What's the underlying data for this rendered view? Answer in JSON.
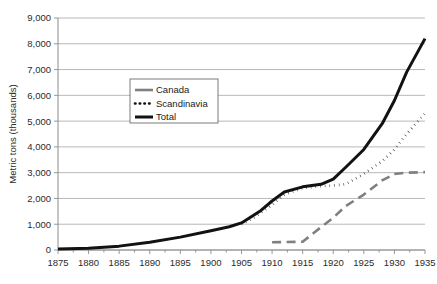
{
  "chart_data": {
    "type": "line",
    "title": "",
    "xlabel": "",
    "ylabel": "Metric tons (thousands)",
    "xlim": [
      1875,
      1935
    ],
    "ylim": [
      0,
      9000
    ],
    "ytick_step": 1000,
    "xtick_step": 5,
    "grid": true,
    "legend_position": "upper-left-inside",
    "xticklabels": [
      "1875",
      "1880",
      "1885",
      "1890",
      "1895",
      "1900",
      "1905",
      "1910",
      "1915",
      "1920",
      "1925",
      "1930",
      "1935"
    ],
    "yticklabels": [
      "0",
      "1,000",
      "2,000",
      "3,000",
      "4,000",
      "5,000",
      "6,000",
      "7,000",
      "8,000",
      "9,000"
    ],
    "series": [
      {
        "name": "Canada",
        "style": "dashed",
        "color": "#808080",
        "width": 2.6,
        "x": [
          1910,
          1915,
          1917,
          1920,
          1922,
          1925,
          1928,
          1930,
          1932,
          1935
        ],
        "values": [
          300,
          320,
          700,
          1250,
          1700,
          2150,
          2700,
          2950,
          3000,
          3020
        ]
      },
      {
        "name": "Scandinavia",
        "style": "dotted",
        "color": "#121212",
        "width": 2.6,
        "x": [
          1905,
          1907,
          1910,
          1912,
          1915,
          1918,
          1920,
          1922,
          1925,
          1928,
          1930,
          1932,
          1935
        ],
        "values": [
          1000,
          1250,
          1750,
          2150,
          2400,
          2480,
          2500,
          2550,
          2950,
          3450,
          3900,
          4500,
          5300
        ]
      },
      {
        "name": "Total",
        "style": "solid",
        "color": "#121212",
        "width": 3.0,
        "x": [
          1875,
          1880,
          1885,
          1890,
          1895,
          1900,
          1903,
          1905,
          1908,
          1910,
          1912,
          1915,
          1918,
          1920,
          1922,
          1925,
          1928,
          1930,
          1932,
          1935
        ],
        "values": [
          40,
          70,
          150,
          300,
          500,
          750,
          900,
          1050,
          1500,
          1900,
          2250,
          2450,
          2550,
          2750,
          3200,
          3900,
          4900,
          5800,
          6900,
          8200
        ]
      }
    ]
  }
}
